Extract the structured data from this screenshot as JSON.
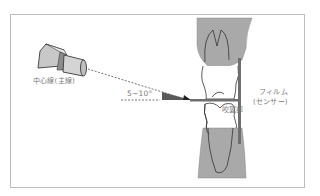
{
  "diagram": {
    "type": "dental-radiography-bitewing-technique",
    "labels": {
      "central_ray": "中心線(主線)",
      "angle": "5~10°",
      "bite_tab": "咬翼部",
      "film_line1": "フィルム",
      "film_line2": "(センサー)"
    },
    "elements": [
      "x-ray-tube-cone",
      "central-ray-dashed-line",
      "horizontal-reference-line",
      "angle-wedge",
      "upper-tooth",
      "lower-tooth",
      "bite-wing-tab",
      "film-sensor"
    ],
    "colors": {
      "frame": "#bdbdbd",
      "gum": "#a9a9a9",
      "wedge": "#5a5a5a",
      "film": "#6e6e6e",
      "tube": "#c8c8c8",
      "text": "#7a7a7a"
    }
  }
}
